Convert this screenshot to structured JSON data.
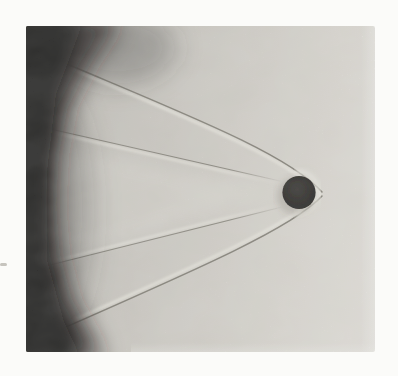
{
  "meta": {
    "image_width": 398,
    "image_height": 376
  },
  "colors": {
    "page_background": "#fbfbf9",
    "photo_base_gray": "#d5d2cc",
    "photo_light_gray": "#e9e6e1",
    "dark_exposure": "#12100e",
    "sphere": "#1d1b19",
    "shock_line_dark": "#7b786f",
    "shock_line_light": "#f3f1e9"
  },
  "scene": {
    "sphere": {
      "cx": "299",
      "cy": "192.5",
      "r": "16.6",
      "halo_cx": "296",
      "halo_cy": "196",
      "halo_r": "19",
      "halo_fill": "rgba(80,76,70,0.22)"
    },
    "bow_shock": {
      "upper_dark_path": "M60,61 C185,114 288,154 322,192",
      "upper_light_path": "M60,64 C184,117 286,157 319,193",
      "lower_dark_path": "M322,196 C294,227 198,269 59,330",
      "lower_light_path": "M319,195 C292,224 196,266 58,327",
      "standoff_arc_path": "M297,172 A21,21 0 0 1 297,214",
      "dark_color": "#7b786f",
      "light_color": "#f3f1e9"
    },
    "wake_shock": {
      "upper_dark_path": "M46,128 L280,181",
      "upper_light_path": "M46,131 L280,184",
      "lower_dark_path": "M42,267 L282,207",
      "lower_light_path": "M42,264 L282,204"
    },
    "dark_region": {
      "core_path": "M16,16 L120,18 L90,64 L68,106 L59,154 L56,206 L60,254 L72,300 L92,336 L104,360 L16,360 Z",
      "inner_path": "M16,16 L84,20 L56,94 L47,172 L47,260 L64,322 L82,360 L16,360 Z",
      "core_fill": "#201d1a",
      "inner_fill": "#0e0d0b",
      "soft_top_fill": "rgba(55,52,48,0.35)",
      "soft_mid_fill": "rgba(60,56,52,0.30)"
    },
    "light_wedge_path": "M74,150 L274,192 L74,254 Z"
  }
}
